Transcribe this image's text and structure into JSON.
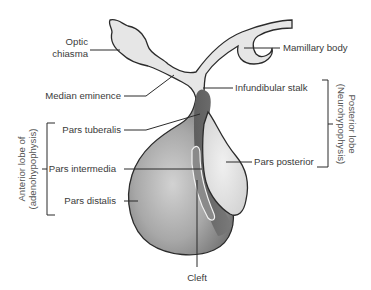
{
  "diagram": {
    "labels": {
      "optic_chiasma_line1": "Optic",
      "optic_chiasma_line2": "chiasma",
      "mamillary_body": "Mamillary  body",
      "median_eminence": "Median eminence",
      "infundibular_stalk": "Infundibular stalk",
      "pars_tuberalis": "Pars tuberalis",
      "pars_intermedia": "Pars intermedia",
      "pars_distalis": "Pars distalis",
      "pars_posterior": "Pars posterior",
      "cleft": "Cleft"
    },
    "groups": {
      "anterior_line1": "Anterior lobe of",
      "anterior_line2": "(adenohypophysis)",
      "posterior_line1": "Posterior lobe",
      "posterior_line2": "(Neurohypophysis)"
    },
    "colors": {
      "outline": "#2b2b2b",
      "light_tissue": "#e4e4e4",
      "anterior_dark": "#6e6e6e",
      "anterior_mid": "#9a9a9a",
      "anterior_light": "#c8c8c8",
      "cleft": "#f2f2f2"
    }
  }
}
